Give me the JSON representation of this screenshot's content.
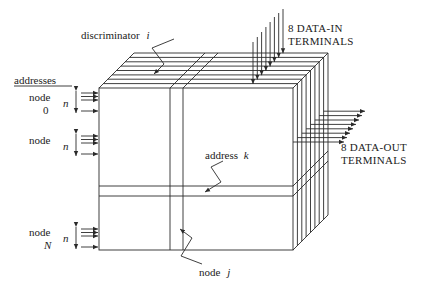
{
  "diagram": {
    "labels": {
      "discriminator": "discriminator",
      "discriminator_var": "i",
      "data_in_line1": "8 DATA-IN",
      "data_in_line2": "TERMINALS",
      "data_out_line1": "8 DATA-OUT",
      "data_out_line2": "TERMINALS",
      "addresses_header": "addresses",
      "node0_line1": "node",
      "node0_line2": "0",
      "node_mid_line1": "node",
      "nodeN_line1": "node",
      "nodeN_line2": "N",
      "n_symbol": "n",
      "address_k": "address",
      "address_k_var": "k",
      "node_j": "node",
      "node_j_var": "j"
    },
    "colors": {
      "stroke": "#2a2a2a",
      "background": "#ffffff"
    },
    "counts": {
      "data_in_terminals": 8,
      "data_out_terminals": 8
    }
  }
}
